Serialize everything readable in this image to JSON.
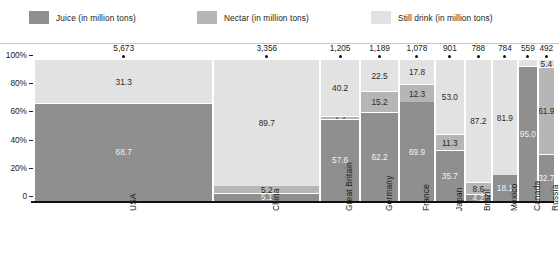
{
  "legend": {
    "items": [
      {
        "label": "Juice (in million tons)",
        "key": "juice",
        "color": "#8f8f8f"
      },
      {
        "label": "Nectar (in million tons)",
        "key": "nectar",
        "color": "#b6b6b6"
      },
      {
        "label": "Still drink (in million tons)",
        "key": "still",
        "color": "#e2e2e2"
      }
    ]
  },
  "axis": {
    "y_ticks": [
      "100%",
      "80%",
      "60%",
      "40%",
      "20%",
      "0"
    ]
  },
  "chart_data": {
    "type": "bar",
    "variant": "marimekko-stacked-100",
    "title": "",
    "xlabel": "",
    "ylabel": "",
    "ylim": [
      0,
      100
    ],
    "grid": false,
    "legend_position": "top",
    "categories": [
      "USA",
      "China",
      "Great Britain",
      "Germany",
      "France",
      "Japan",
      "Brazil",
      "Mexico",
      "Canada",
      "Russia"
    ],
    "totals": [
      5673,
      3356,
      1205,
      1189,
      1078,
      901,
      788,
      784,
      559,
      492
    ],
    "totals_display": [
      "5,673",
      "3,356",
      "1,205",
      "1,189",
      "1,078",
      "901",
      "788",
      "784",
      "559",
      "492"
    ],
    "series": [
      {
        "name": "Juice (in million tons)",
        "key": "juice",
        "values": [
          68.7,
          5.1,
          57.6,
          62.2,
          69.9,
          35.7,
          4.2,
          18.1,
          95.0,
          32.7
        ],
        "labels": [
          "68.7",
          "5.1",
          "57.6",
          "62.2",
          "69.9",
          "35.7",
          "4.2",
          "18.1",
          "95.0",
          "32.7"
        ]
      },
      {
        "name": "Nectar (in million tons)",
        "key": "nectar",
        "values": [
          0,
          5.2,
          2.2,
          15.2,
          12.3,
          11.3,
          8.6,
          0,
          0,
          61.9
        ],
        "labels": [
          "",
          "5.2",
          "2.2",
          "15.2",
          "12.3",
          "11.3",
          "8.6",
          "",
          "",
          "61.9"
        ]
      },
      {
        "name": "Still drink (in million tons)",
        "key": "still",
        "values": [
          31.3,
          89.7,
          40.2,
          22.5,
          17.8,
          53.0,
          87.2,
          81.9,
          5.0,
          5.4
        ],
        "labels": [
          "31.3",
          "89.7",
          "40.2",
          "22.5",
          "17.8",
          "53.0",
          "87.2",
          "81.9",
          "",
          "5.4"
        ]
      }
    ]
  }
}
